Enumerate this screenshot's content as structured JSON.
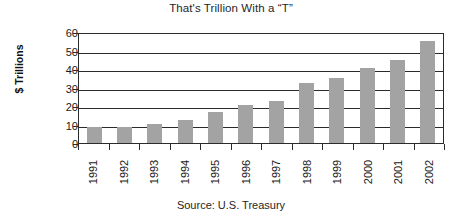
{
  "chart_data": {
    "type": "bar",
    "title": "That's Trillion With a “T”",
    "xlabel": "",
    "ylabel": "$ Trillions",
    "categories": [
      "1991",
      "1992",
      "1993",
      "1994",
      "1995",
      "1996",
      "1997",
      "1998",
      "1999",
      "2000",
      "2001",
      "2002"
    ],
    "values": [
      8.5,
      8.5,
      10.5,
      12.5,
      16.5,
      20.5,
      22.5,
      32.5,
      35,
      40.5,
      45,
      55
    ],
    "ylim": [
      0,
      60
    ],
    "ytick_labels": [
      "60",
      "50",
      "40",
      "30",
      "20",
      "10",
      "0"
    ],
    "ytick_values": [
      60,
      50,
      40,
      30,
      20,
      10,
      0
    ],
    "grid": true,
    "legend": false,
    "bar_color": "#a3a3a3",
    "axis_color": "#2b2b2b",
    "source_note": "Source: U.S. Treasury"
  }
}
